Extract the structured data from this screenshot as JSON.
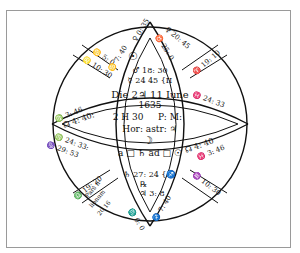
{
  "figure": {
    "center": {
      "line1": "Die 2♃ 11 Iune",
      "line2": "1635",
      "line3_hour": "2 H 30",
      "line3_ampm": "P: M:",
      "line4": "Hor: astr: ♃",
      "moon_symbol": "☽",
      "aspect_line": "a □ ♄ ad □ ☉"
    },
    "top_inner": {
      "sun": "☉",
      "mars": "♂ 18: 30",
      "mercury": "☿ 24  45 {II"
    },
    "bottom_inner": {
      "saturn": "♄ 27: 24 {♐",
      "retro": "℞",
      "jupiter": "♃ 3: 8"
    },
    "bands": {
      "top_left_outer": "♋ 5: 0",
      "top_left_inner": "♌ 10: 30",
      "top_left_vesica": "♋ 7: 40",
      "top_vesica_cusp": "♀ 0: 35",
      "top_right_vesica": "♉ 25: 0",
      "top_right_outer": "♀ 20: 45",
      "top_right_diag": "♈ 19: 10",
      "mid_left_upper": "♍ 3: 46",
      "mid_left_lower": "☊ 4: 40:",
      "mid_right_upper": "♓ 24: 33",
      "mid_left_band2": "♍ 24: 33:",
      "mid_left_band3": "♑ 29: 53",
      "mid_right_lower": "☊ 4: 40",
      "mid_right_lower2": "♓ 3: 46",
      "bot_left_diag": "♎ 19: 20",
      "bot_left_pars": "Pars fi-",
      "bot_left_pars2": "lionum",
      "bot_left_pars3": "20.16",
      "bot_vesica_left": "♏ 0: 0",
      "bot_vesica_right": "♐ 7: 40",
      "bot_right_diag": "♒ 10: 30"
    }
  }
}
